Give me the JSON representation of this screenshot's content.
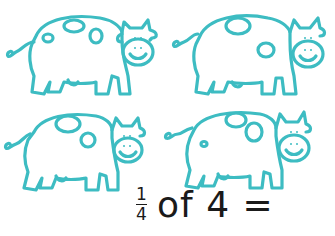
{
  "illustration": {
    "subject": "cow",
    "count": 4,
    "outline_color": "#3dbcc2",
    "cows": [
      {
        "position": "top-left"
      },
      {
        "position": "top-right"
      },
      {
        "position": "bottom-left"
      },
      {
        "position": "bottom-right"
      }
    ]
  },
  "question": {
    "fraction": {
      "numerator": "1",
      "denominator": "4"
    },
    "text": "of 4 ="
  },
  "colors": {
    "text": "#1a1a1a",
    "background": "#ffffff"
  }
}
